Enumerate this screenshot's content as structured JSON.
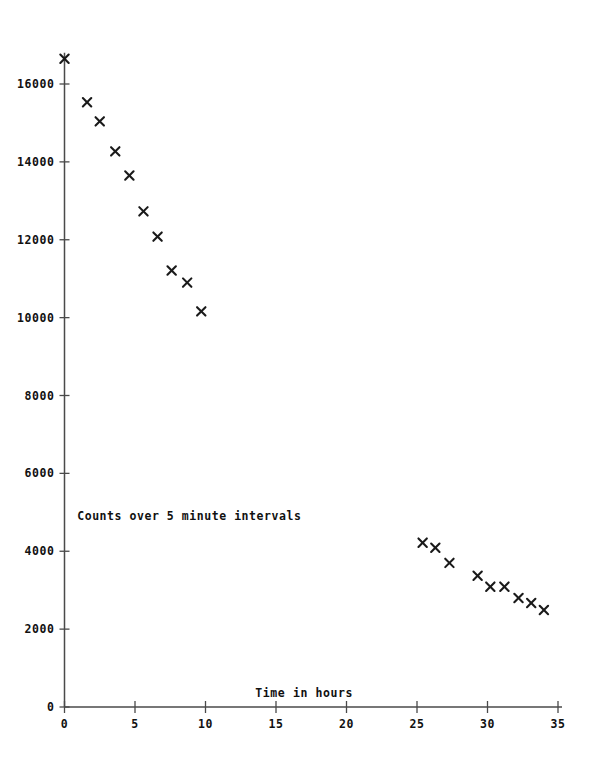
{
  "chart_data": {
    "type": "scatter",
    "title": "",
    "subtitle": "",
    "xlabel": "Time in hours",
    "ylabel": "",
    "annotations": [
      {
        "text": "Counts over 5 minute intervals",
        "x": 0.9,
        "y": 4800
      }
    ],
    "xlim": [
      0,
      35
    ],
    "ylim": [
      0,
      16800
    ],
    "xticks": [
      0,
      5,
      10,
      15,
      20,
      25,
      30,
      35
    ],
    "xticklabels": [
      "0",
      "5",
      "10",
      "15",
      "20",
      "25",
      "30",
      "35"
    ],
    "yticks": [
      0,
      2000,
      4000,
      6000,
      8000,
      10000,
      12000,
      14000,
      16000
    ],
    "yticklabels": [
      "0",
      "2000",
      "4000",
      "6000",
      "8000",
      "10000",
      "12000",
      "14000",
      "16000"
    ],
    "grid": false,
    "legend": false,
    "marker": "x",
    "marker_color": "#1a1a1a",
    "axis_color": "#4a4a4a",
    "series": [
      {
        "name": "Counts over 5 minute intervals",
        "points": [
          {
            "x": 0.0,
            "y": 16650
          },
          {
            "x": 1.6,
            "y": 15530
          },
          {
            "x": 2.5,
            "y": 15040
          },
          {
            "x": 3.6,
            "y": 14270
          },
          {
            "x": 4.6,
            "y": 13650
          },
          {
            "x": 5.6,
            "y": 12730
          },
          {
            "x": 6.6,
            "y": 12080
          },
          {
            "x": 7.6,
            "y": 11210
          },
          {
            "x": 8.7,
            "y": 10900
          },
          {
            "x": 9.7,
            "y": 10160
          },
          {
            "x": 25.4,
            "y": 4220
          },
          {
            "x": 26.3,
            "y": 4090
          },
          {
            "x": 27.3,
            "y": 3700
          },
          {
            "x": 29.3,
            "y": 3370
          },
          {
            "x": 30.2,
            "y": 3090
          },
          {
            "x": 31.2,
            "y": 3090
          },
          {
            "x": 32.2,
            "y": 2800
          },
          {
            "x": 33.1,
            "y": 2670
          },
          {
            "x": 34.0,
            "y": 2490
          }
        ]
      }
    ]
  }
}
